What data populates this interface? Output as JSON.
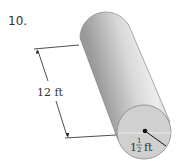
{
  "problem": {
    "number": "10.",
    "figure": "cylinder",
    "length_label": "12 ft",
    "radius_label": {
      "whole": "1",
      "numerator": "1",
      "denominator": "2",
      "unit": "ft"
    }
  },
  "colors": {
    "cylinder_light": "#e6e6e6",
    "cylinder_mid": "#b5b5b5",
    "cylinder_dark": "#8a8a8a",
    "end_face": "#d2d2d2",
    "line": "#222222"
  }
}
